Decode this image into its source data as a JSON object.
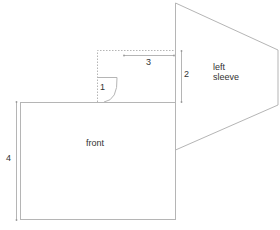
{
  "diagram": {
    "pieces": {
      "front": "front",
      "sleeve_line1": "left",
      "sleeve_line2": "sleeve"
    },
    "measurements": {
      "m1": "1",
      "m2": "2",
      "m3": "3",
      "m4": "4"
    },
    "colors": {
      "line": "#b8b8b8",
      "text": "#333333"
    }
  }
}
